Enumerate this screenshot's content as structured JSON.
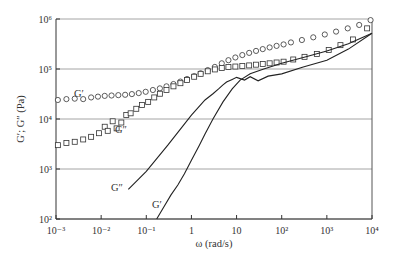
{
  "chart_data": {
    "type": "scatter",
    "title": "",
    "xlabel": "ω (rad/s)",
    "ylabel": "G′; G″ (Pa)",
    "xscale": "log",
    "yscale": "log",
    "xlim": [
      0.001,
      10000
    ],
    "ylim": [
      100,
      1000000
    ],
    "grid": "horizontal major lines",
    "legend": "none (inline labels)",
    "x_ticks": [
      "10⁻³",
      "10⁻²",
      "10⁻¹",
      "1",
      "10",
      "10²",
      "10³",
      "10⁴"
    ],
    "y_ticks": [
      "10²",
      "10³",
      "10⁴",
      "10⁵",
      "10⁶"
    ],
    "series": [
      {
        "name": "G′ (symbols)",
        "marker": "circle",
        "label": "G′",
        "x": [
          0.0011,
          0.0017,
          0.0026,
          0.004,
          0.006,
          0.0085,
          0.012,
          0.017,
          0.024,
          0.034,
          0.048,
          0.068,
          0.097,
          0.14,
          0.2,
          0.28,
          0.4,
          0.57,
          0.8,
          1.15,
          1.6,
          2.3,
          3.3,
          4.7,
          6.6,
          9.4,
          13.4,
          19,
          27,
          38,
          54,
          77,
          110,
          160,
          280,
          500,
          900,
          1600,
          2900,
          5200,
          9300
        ],
        "y": [
          24000,
          25000,
          25500,
          25000,
          27000,
          28000,
          29000,
          29500,
          30000,
          30500,
          31500,
          33000,
          35000,
          38000,
          41000,
          45000,
          50000,
          56000,
          63000,
          72000,
          82000,
          95000,
          110000,
          130000,
          150000,
          170000,
          190000,
          210000,
          230000,
          250000,
          270000,
          290000,
          310000,
          340000,
          380000,
          430000,
          490000,
          560000,
          650000,
          760000,
          950000
        ]
      },
      {
        "name": "G″ (symbols)",
        "marker": "square",
        "label": "G″",
        "x": [
          0.0011,
          0.0017,
          0.0026,
          0.004,
          0.006,
          0.009,
          0.012,
          0.014,
          0.018,
          0.022,
          0.028,
          0.036,
          0.045,
          0.06,
          0.08,
          0.11,
          0.15,
          0.2,
          0.28,
          0.4,
          0.57,
          0.8,
          1.15,
          1.6,
          2.3,
          3.3,
          4.7,
          6.6,
          9.4,
          13.4,
          19,
          27,
          38,
          54,
          77,
          110,
          180,
          320,
          600,
          1100,
          2000,
          3800,
          7800
        ],
        "y": [
          3000,
          3300,
          3500,
          3900,
          4400,
          5200,
          7000,
          5800,
          9000,
          6500,
          8500,
          12000,
          13000,
          16000,
          19000,
          22000,
          27000,
          32000,
          38000,
          45000,
          52000,
          60000,
          70000,
          80000,
          90000,
          98000,
          105000,
          110000,
          112000,
          115000,
          118000,
          122000,
          126000,
          130000,
          135000,
          140000,
          155000,
          175000,
          200000,
          240000,
          300000,
          390000,
          650000
        ]
      },
      {
        "name": "G″ (line)",
        "marker": "none",
        "label": "G″",
        "x": [
          0.04,
          0.1,
          0.3,
          1,
          2,
          3,
          4,
          5,
          6,
          8,
          10,
          15,
          20,
          30,
          50,
          100,
          300,
          1000,
          3000,
          10000
        ],
        "y": [
          390,
          900,
          3000,
          12000,
          24000,
          32000,
          40000,
          48000,
          55000,
          62000,
          68000,
          60000,
          70000,
          58000,
          72000,
          80000,
          110000,
          150000,
          250000,
          520000
        ]
      },
      {
        "name": "G′ (line)",
        "marker": "none",
        "label": "G′",
        "x": [
          0.17,
          0.25,
          0.35,
          0.5,
          0.7,
          1,
          1.5,
          2,
          3,
          5,
          8,
          12,
          20,
          40,
          100,
          300,
          1000,
          3000,
          10000
        ],
        "y": [
          100,
          180,
          300,
          480,
          800,
          1500,
          3000,
          5000,
          10000,
          22000,
          40000,
          60000,
          80000,
          100000,
          130000,
          170000,
          230000,
          320000,
          520000
        ]
      }
    ],
    "annotations": [
      {
        "text": "G′",
        "near": "circle series at ω≈0.004"
      },
      {
        "text": "G″",
        "near": "square series at ω≈0.03"
      },
      {
        "text": "G″",
        "near": "line start at ω≈0.02, 400 Pa"
      },
      {
        "text": "G′",
        "near": "line start at ω≈0.1, 150 Pa"
      }
    ]
  },
  "labels": {
    "xlabel": "ω (rad/s)",
    "ylabel": "G′; G″ (Pa)",
    "gp_sym": "G′",
    "gpp_sym": "G″",
    "gpp_line": "G″",
    "gp_line": "G′"
  }
}
